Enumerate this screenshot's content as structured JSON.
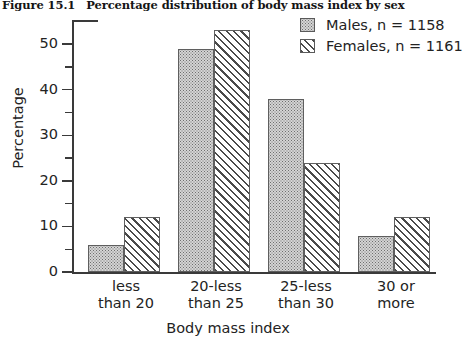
{
  "figure": {
    "number": "Figure 15.1",
    "title": "Percentage distribution of body mass index by sex"
  },
  "legend": {
    "position": "top-right",
    "entries": [
      {
        "label": "Males,  n = 1158",
        "pattern": "dotted",
        "swatch_name": "males-swatch"
      },
      {
        "label": "Females,  n = 1161",
        "pattern": "hatched",
        "swatch_name": "females-swatch"
      }
    ]
  },
  "chart_data": {
    "type": "bar",
    "title": "Percentage distribution of body mass index by sex",
    "xlabel": "Body mass index",
    "ylabel": "Percentage",
    "categories": [
      "less than 20",
      "20-less than 25",
      "25-less than 30",
      "30 or more"
    ],
    "category_lines": [
      [
        "less",
        "than 20"
      ],
      [
        "20-less",
        "than 25"
      ],
      [
        "25-less",
        "than 30"
      ],
      [
        "30 or",
        "more"
      ]
    ],
    "series": [
      {
        "name": "Males,  n = 1158",
        "n": 1158,
        "values": [
          6,
          49,
          38,
          8
        ]
      },
      {
        "name": "Females,  n = 1161",
        "n": 1161,
        "values": [
          12,
          53,
          24,
          12
        ]
      }
    ],
    "ylim": [
      0,
      55
    ],
    "yticks": [
      0,
      10,
      20,
      30,
      40,
      50
    ],
    "ytick_labels": [
      "0",
      "10",
      "20",
      "30",
      "40",
      "50"
    ],
    "yminor_ticks": [
      5,
      15,
      25,
      35,
      45
    ],
    "grid": false
  }
}
